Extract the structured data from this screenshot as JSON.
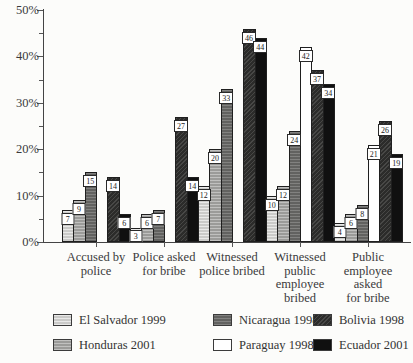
{
  "page": {
    "background": "#fcfcfa"
  },
  "chart_data": {
    "type": "bar",
    "title": "",
    "xlabel": "",
    "ylabel": "",
    "ylim": [
      0,
      50
    ],
    "ytick_step": 10,
    "minor_tick_step": 5,
    "ytick_labels": [
      "0%",
      "10%",
      "20%",
      "30%",
      "40%",
      "50%"
    ],
    "grid": "off",
    "legend_position": "bottom",
    "value_labels": "boxed-white",
    "categories": [
      "Accused by police",
      "Police asked for bribe",
      "Witnessed police bribed",
      "Witnessed public employee bribed",
      "Public employee asked for bribe"
    ],
    "category_lines": [
      [
        "Accused by",
        "police"
      ],
      [
        "Police asked",
        "for bribe"
      ],
      [
        "Witnessed",
        "police bribed"
      ],
      [
        "Witnessed",
        "public",
        "employee",
        "bribed"
      ],
      [
        "Public",
        "employee",
        "asked",
        "for bribe"
      ]
    ],
    "series": [
      {
        "name": "El Salvador 1999",
        "color": "#d7d7d5",
        "values": [
          7,
          3,
          12,
          10,
          4
        ]
      },
      {
        "name": "Honduras 2001",
        "color": "#a8a8a6",
        "values": [
          9,
          6,
          20,
          12,
          6
        ]
      },
      {
        "name": "Nicaragua 1998",
        "color": "#6d6d6b",
        "values": [
          15,
          7,
          33,
          24,
          8
        ]
      },
      {
        "name": "Paraguay 1998",
        "color": "#ffffff",
        "values": [
          null,
          null,
          null,
          42,
          21
        ]
      },
      {
        "name": "Bolivia 1998",
        "color": "#333331",
        "values": [
          14,
          27,
          46,
          37,
          26
        ]
      },
      {
        "name": "Ecuador 2001",
        "color": "#101010",
        "values": [
          6,
          14,
          44,
          34,
          19
        ]
      }
    ],
    "legend_display_order": [
      0,
      2,
      4,
      1,
      3,
      5
    ]
  }
}
